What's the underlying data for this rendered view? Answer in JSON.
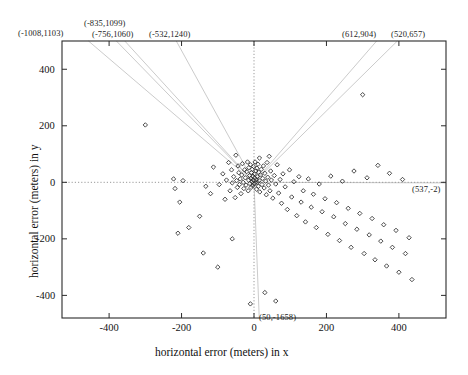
{
  "chart_data": {
    "type": "scatter",
    "title": "",
    "xlabel": "horizontal error (meters) in x",
    "ylabel": "horizontal error (meters) in y",
    "xlim": [
      -530,
      530
    ],
    "ylim": [
      -480,
      500
    ],
    "xticks": [
      -400,
      -200,
      0,
      200,
      400
    ],
    "yticks": [
      -400,
      -200,
      0,
      200,
      400
    ],
    "xticklabels": [
      "-400",
      "-200",
      "0",
      "200",
      "400"
    ],
    "yticklabels": [
      "-400",
      "-200",
      "0",
      "200",
      "400"
    ],
    "grid": false,
    "legend": null,
    "marker": "open-diamond",
    "marker_color": "#2b2b2b",
    "points": [
      [
        -300,
        203
      ],
      [
        -222,
        12
      ],
      [
        -218,
        -22
      ],
      [
        -205,
        -70
      ],
      [
        -196,
        6
      ],
      [
        -133,
        -14
      ],
      [
        -120,
        -40
      ],
      [
        -112,
        54
      ],
      [
        -96,
        -8
      ],
      [
        -86,
        30
      ],
      [
        -80,
        -60
      ],
      [
        -76,
        8
      ],
      [
        -70,
        70
      ],
      [
        -66,
        -30
      ],
      [
        -62,
        44
      ],
      [
        -60,
        -2
      ],
      [
        -56,
        20
      ],
      [
        -52,
        -54
      ],
      [
        -50,
        96
      ],
      [
        -48,
        6
      ],
      [
        -46,
        -18
      ],
      [
        -44,
        58
      ],
      [
        -42,
        34
      ],
      [
        -40,
        -8
      ],
      [
        -38,
        12
      ],
      [
        -36,
        -40
      ],
      [
        -34,
        26
      ],
      [
        -32,
        66
      ],
      [
        -30,
        0
      ],
      [
        -28,
        -22
      ],
      [
        -26,
        44
      ],
      [
        -24,
        16
      ],
      [
        -22,
        -10
      ],
      [
        -20,
        38
      ],
      [
        -18,
        72
      ],
      [
        -16,
        -30
      ],
      [
        -15,
        8
      ],
      [
        -14,
        52
      ],
      [
        -12,
        24
      ],
      [
        -11,
        -4
      ],
      [
        -10,
        62
      ],
      [
        -9,
        14
      ],
      [
        -8,
        -18
      ],
      [
        -7,
        34
      ],
      [
        -6,
        2
      ],
      [
        -5,
        46
      ],
      [
        -4,
        -12
      ],
      [
        -3,
        22
      ],
      [
        -2,
        8
      ],
      [
        -1,
        56
      ],
      [
        0,
        -6
      ],
      [
        1,
        30
      ],
      [
        2,
        16
      ],
      [
        3,
        72
      ],
      [
        4,
        -2
      ],
      [
        5,
        40
      ],
      [
        6,
        10
      ],
      [
        7,
        -24
      ],
      [
        8,
        50
      ],
      [
        9,
        20
      ],
      [
        10,
        0
      ],
      [
        11,
        64
      ],
      [
        12,
        -14
      ],
      [
        13,
        36
      ],
      [
        14,
        6
      ],
      [
        15,
        86
      ],
      [
        16,
        -34
      ],
      [
        18,
        26
      ],
      [
        20,
        46
      ],
      [
        22,
        -8
      ],
      [
        24,
        14
      ],
      [
        26,
        58
      ],
      [
        28,
        -20
      ],
      [
        30,
        32
      ],
      [
        32,
        4
      ],
      [
        34,
        -44
      ],
      [
        36,
        70
      ],
      [
        38,
        18
      ],
      [
        40,
        -10
      ],
      [
        42,
        92
      ],
      [
        44,
        -30
      ],
      [
        46,
        40
      ],
      [
        48,
        8
      ],
      [
        52,
        -56
      ],
      [
        56,
        24
      ],
      [
        60,
        -6
      ],
      [
        64,
        62
      ],
      [
        68,
        -38
      ],
      [
        72,
        10
      ],
      [
        76,
        -74
      ],
      [
        80,
        30
      ],
      [
        86,
        -16
      ],
      [
        92,
        -96
      ],
      [
        98,
        44
      ],
      [
        104,
        -52
      ],
      [
        110,
        2
      ],
      [
        118,
        -118
      ],
      [
        124,
        20
      ],
      [
        130,
        -70
      ],
      [
        136,
        -30
      ],
      [
        142,
        -140
      ],
      [
        150,
        12
      ],
      [
        158,
        -88
      ],
      [
        164,
        -42
      ],
      [
        172,
        -160
      ],
      [
        180,
        -6
      ],
      [
        188,
        -104
      ],
      [
        196,
        -58
      ],
      [
        204,
        -184
      ],
      [
        212,
        22
      ],
      [
        220,
        -122
      ],
      [
        228,
        -72
      ],
      [
        236,
        -206
      ],
      [
        244,
        4
      ],
      [
        252,
        -146
      ],
      [
        260,
        -92
      ],
      [
        268,
        -230
      ],
      [
        276,
        40
      ],
      [
        284,
        -166
      ],
      [
        292,
        -110
      ],
      [
        300,
        310
      ],
      [
        304,
        -252
      ],
      [
        312,
        16
      ],
      [
        318,
        -186
      ],
      [
        326,
        -128
      ],
      [
        334,
        -274
      ],
      [
        342,
        60
      ],
      [
        350,
        -208
      ],
      [
        358,
        -150
      ],
      [
        366,
        -296
      ],
      [
        374,
        32
      ],
      [
        382,
        -230
      ],
      [
        392,
        -170
      ],
      [
        400,
        -318
      ],
      [
        410,
        10
      ],
      [
        418,
        -252
      ],
      [
        428,
        -196
      ],
      [
        436,
        -344
      ],
      [
        -10,
        -430
      ],
      [
        30,
        -390
      ],
      [
        60,
        -420
      ],
      [
        -140,
        -250
      ],
      [
        -100,
        -300
      ],
      [
        -60,
        -200
      ],
      [
        -180,
        -160
      ],
      [
        -150,
        -120
      ],
      [
        -210,
        -180
      ]
    ],
    "reference_lines": [
      {
        "label": "(-1008,1103)",
        "x": -1008,
        "y": 1103
      },
      {
        "label": "(-835,1099)",
        "x": -835,
        "y": 1099
      },
      {
        "label": "(-756,1060)",
        "x": -756,
        "y": 1060
      },
      {
        "label": "(-532,1240)",
        "x": -532,
        "y": 1240
      },
      {
        "label": "(612,904)",
        "x": 612,
        "y": 904
      },
      {
        "label": "(520,657)",
        "x": 520,
        "y": 657
      },
      {
        "label": "(537,-2)",
        "x": 537,
        "y": -2
      },
      {
        "label": "(50,-1658)",
        "x": 50,
        "y": -1658
      }
    ],
    "annotations": [
      {
        "name": "annotation-neg1008-1103",
        "label": "(-1008,1103)",
        "left": 18,
        "top": 28
      },
      {
        "name": "annotation-neg835-1099",
        "label": "(-835,1099)",
        "left": 84,
        "top": 18
      },
      {
        "name": "annotation-neg756-1060",
        "label": "(-756,1060)",
        "left": 92,
        "top": 29
      },
      {
        "name": "annotation-neg532-1240",
        "label": "(-532,1240)",
        "left": 149,
        "top": 29
      },
      {
        "name": "annotation-612-904",
        "label": "(612,904)",
        "left": 342,
        "top": 29
      },
      {
        "name": "annotation-520-657",
        "label": "(520,657)",
        "left": 391,
        "top": 29
      },
      {
        "name": "annotation-537-neg2",
        "label": "(537,-2)",
        "left": 412,
        "top": 184
      },
      {
        "name": "annotation-50-neg1658",
        "label": "(50,-1658)",
        "left": 259,
        "top": 312
      }
    ]
  },
  "axes": {
    "x_title": "horizontal error (meters) in x",
    "y_title": "horizontal error (meters) in y"
  }
}
